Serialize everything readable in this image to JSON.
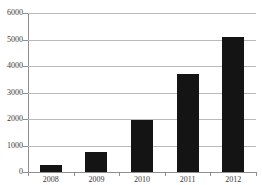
{
  "chart_data": {
    "type": "bar",
    "title": "",
    "xlabel": "",
    "ylabel": "",
    "categories": [
      "2008",
      "2009",
      "2010",
      "2011",
      "2012"
    ],
    "values": [
      260,
      770,
      1980,
      3700,
      5100
    ],
    "ylim": [
      0,
      6000
    ],
    "yticks": [
      0,
      1000,
      2000,
      3000,
      4000,
      5000,
      6000
    ],
    "ytick_labels": [
      "0",
      "1000",
      "2000",
      "3000",
      "4000",
      "5000",
      "6000"
    ],
    "grid": true,
    "legend": "none",
    "bar_color": "#141414",
    "grid_color": "#b9b9b9",
    "axis_color": "#8f8f8f"
  }
}
